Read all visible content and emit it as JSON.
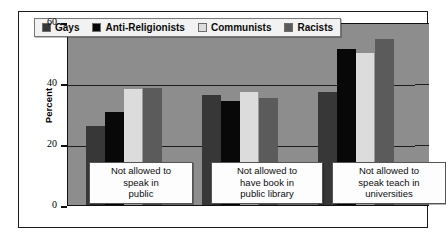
{
  "chart_data": {
    "type": "bar",
    "title": "",
    "xlabel": "",
    "ylabel": "Percent",
    "ylim": [
      0,
      60
    ],
    "yticks": [
      0,
      20,
      40,
      60
    ],
    "ytick_labels": [
      "0",
      "20",
      "40",
      "60"
    ],
    "grid": true,
    "legend_position": "top-left-inside",
    "categories": [
      "Not allowed to speak in public",
      "Not allowed to have book in public library",
      "Not allowed to speak teach in universities"
    ],
    "category_lines": [
      [
        "Not allowed to",
        "speak in",
        "public"
      ],
      [
        "Not allowed to",
        "have book in",
        "public library"
      ],
      [
        "Not allowed to",
        "speak teach in",
        "universities"
      ]
    ],
    "series": [
      {
        "name": "Gays",
        "color": "#373737",
        "values": [
          26,
          36,
          37
        ]
      },
      {
        "name": "Anti-Religionists",
        "color": "#080808",
        "values": [
          30.5,
          34,
          51
        ]
      },
      {
        "name": "Communists",
        "color": "#dcdcdc",
        "values": [
          38,
          37,
          50
        ]
      },
      {
        "name": "Racists",
        "color": "#5b5b5b",
        "values": [
          38.5,
          35,
          54.5
        ]
      }
    ]
  },
  "colors": {
    "plot_background": "#8d8d8d",
    "figure_background": "#ffffff",
    "axis": "#111111",
    "gridline": "#1d1d1d",
    "legend_background": "#f2f2f2",
    "callout_background": "#fdfdfd"
  }
}
